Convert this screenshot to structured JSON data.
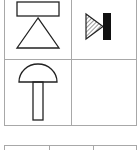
{
  "symbol_table": {
    "rows": [
      {
        "cells": [
          {
            "symbol": "ground-symbol",
            "description": "rectangle above triangle"
          },
          {
            "symbol": "diode-symbol",
            "description": "hatched triangle with black bar"
          }
        ]
      },
      {
        "cells": [
          {
            "symbol": "mushroom-button-symbol",
            "description": "semicircle cap on stem"
          },
          {
            "symbol": "",
            "description": ""
          }
        ]
      }
    ]
  },
  "next_table": {
    "columns": 3
  },
  "colors": {
    "line": "#222222",
    "grid": "#a8a8a8",
    "fill": "#111111"
  }
}
